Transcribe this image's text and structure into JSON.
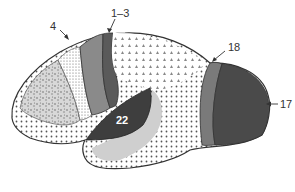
{
  "diagram": {
    "type": "brain-lateral-view",
    "labels": {
      "area_4": "4",
      "area_1_3": "1–3",
      "area_18": "18",
      "area_17": "17",
      "area_22": "22"
    },
    "colors": {
      "outline": "#333333",
      "motor_cortex": "#8a8a8a",
      "somatosensory": "#5a5a5a",
      "visual_18": "#7a7a7a",
      "visual_17": "#4a4a4a",
      "auditory_22": "#3e3e3e",
      "auditory_halo": "#cfcfcf",
      "background": "#ffffff"
    }
  }
}
